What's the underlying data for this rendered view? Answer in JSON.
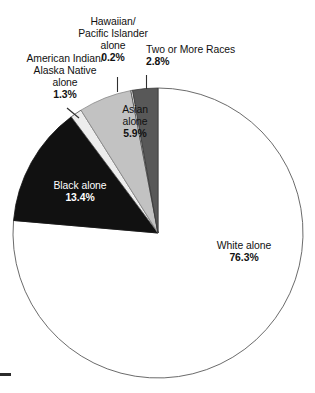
{
  "chart_data": {
    "type": "pie",
    "title": "",
    "subtitle": "",
    "xlabel": "",
    "ylabel": "",
    "legend_position": "none",
    "grid": false,
    "units": "percent",
    "total": 100.0,
    "start_angle_deg": 0,
    "direction": "clockwise",
    "categories": [
      "White alone",
      "Black alone",
      "American Indian/ Alaska Native alone",
      "Asian alone",
      "Hawaiian/ Pacific Islander alone",
      "Two or More Races"
    ],
    "values": [
      76.3,
      13.4,
      1.3,
      5.9,
      0.2,
      2.8
    ],
    "slices": [
      {
        "id": "white",
        "name_lines": [
          "White alone"
        ],
        "value": 76.3,
        "value_label": "76.3%",
        "fill": "#ffffff",
        "stroke": "#5a5a5a",
        "label_placement": "inside",
        "label_color": "#111111"
      },
      {
        "id": "black",
        "name_lines": [
          "Black alone"
        ],
        "value": 13.4,
        "value_label": "13.4%",
        "fill": "#111111",
        "stroke": "#111111",
        "label_placement": "inside",
        "label_color": "#ffffff"
      },
      {
        "id": "american-indian",
        "name_lines": [
          "American Indian/",
          "Alaska Native",
          "alone"
        ],
        "value": 1.3,
        "value_label": "1.3%",
        "fill": "#ededed",
        "stroke": "#4a4a4a",
        "label_placement": "callout",
        "label_color": "#111111"
      },
      {
        "id": "asian",
        "name_lines": [
          "Asian",
          "alone"
        ],
        "value": 5.9,
        "value_label": "5.9%",
        "fill": "#c2c2c2",
        "stroke": "#8a8a8a",
        "label_placement": "inside",
        "label_color": "#111111"
      },
      {
        "id": "hawaiian",
        "name_lines": [
          "Hawaiian/",
          "Pacific Islander",
          "alone"
        ],
        "value": 0.2,
        "value_label": "0.2%",
        "fill": "#f2f2f2",
        "stroke": "#3d3d3d",
        "label_placement": "callout",
        "label_color": "#111111"
      },
      {
        "id": "two-or-more",
        "name_lines": [
          "Two or More Races"
        ],
        "value": 2.8,
        "value_label": "2.8%",
        "fill": "#585858",
        "stroke": "#3a3a3a",
        "label_placement": "callout",
        "label_color": "#111111"
      }
    ]
  },
  "labels": {
    "hawaiian": {
      "line1": "Hawaiian/",
      "line2": "Pacific Islander",
      "line3": "alone",
      "pct": "0.2%"
    },
    "two_or_more": {
      "line1": "Two or More Races",
      "pct": "2.8%"
    },
    "american_indian": {
      "line1": "American Indian/",
      "line2": "Alaska Native",
      "line3": "alone",
      "pct": "1.3%"
    },
    "asian": {
      "line1": "Asian",
      "line2": "alone",
      "pct": "5.9%"
    },
    "black": {
      "line1": "Black alone",
      "pct": "13.4%"
    },
    "white": {
      "line1": "White alone",
      "pct": "76.3%"
    }
  },
  "colors": {
    "white_slice": "#ffffff",
    "black_slice": "#111111",
    "asian_slice": "#c2c2c2",
    "two_or_more_slice": "#585858",
    "american_indian_slice": "#ededed",
    "hawaiian_slice": "#f2f2f2",
    "outline": "#5a5a5a",
    "text": "#1a1a1a"
  }
}
